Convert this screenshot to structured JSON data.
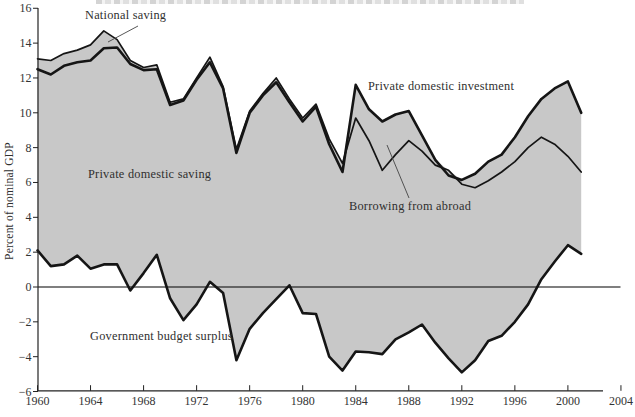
{
  "chart_data": {
    "type": "area",
    "ylabel": "Percent of nominal GDP",
    "xlim": [
      1960,
      2004
    ],
    "ylim": [
      -6,
      16
    ],
    "grid": false,
    "legend": "none (direct area labels with leader lines)",
    "x_ticks": [
      1960,
      1964,
      1968,
      1972,
      1976,
      1980,
      1984,
      1988,
      1992,
      1996,
      2000,
      2004
    ],
    "y_tick_values": [
      16,
      14,
      12,
      10,
      8,
      6,
      4,
      2,
      0,
      -2,
      -4,
      -6
    ],
    "y_tick_labels": [
      "16",
      "14",
      "12",
      "10",
      "8",
      "6",
      "4",
      "2",
      "0",
      "−2",
      "−4",
      "−6"
    ],
    "years": [
      1960,
      1961,
      1962,
      1963,
      1964,
      1965,
      1966,
      1967,
      1968,
      1969,
      1970,
      1971,
      1972,
      1973,
      1974,
      1975,
      1976,
      1977,
      1978,
      1979,
      1980,
      1981,
      1982,
      1983,
      1984,
      1985,
      1986,
      1987,
      1988,
      1989,
      1990,
      1991,
      1992,
      1993,
      1994,
      1995,
      1996,
      1997,
      1998,
      1999,
      2000,
      2001
    ],
    "series": [
      {
        "name": "National saving",
        "style": "thin dark line",
        "values": [
          13.1,
          13.0,
          13.4,
          13.6,
          13.9,
          14.7,
          14.2,
          13.0,
          12.6,
          12.75,
          10.6,
          10.8,
          12.0,
          13.2,
          11.5,
          7.9,
          10.1,
          11.1,
          12.0,
          10.8,
          9.7,
          10.5,
          8.5,
          7.1,
          9.7,
          8.4,
          6.7,
          7.6,
          8.4,
          7.8,
          7.0,
          6.7,
          5.9,
          5.7,
          6.1,
          6.6,
          7.2,
          8.0,
          8.6,
          8.2,
          7.5,
          6.6
        ]
      },
      {
        "name": "Private domestic investment",
        "style": "thick dark line (top of shaded area in later years)",
        "values": [
          12.5,
          12.2,
          12.7,
          12.9,
          13.0,
          13.7,
          13.75,
          12.8,
          12.45,
          12.5,
          10.45,
          10.7,
          11.9,
          12.9,
          11.4,
          7.7,
          10.0,
          11.0,
          11.75,
          10.6,
          9.5,
          10.35,
          8.2,
          6.6,
          11.6,
          10.2,
          9.5,
          9.9,
          10.1,
          8.7,
          7.3,
          6.4,
          6.15,
          6.5,
          7.2,
          7.6,
          8.6,
          9.8,
          10.8,
          11.4,
          11.8,
          10.0
        ]
      },
      {
        "name": "Government budget surplus",
        "style": "thick dark line (bottom of shaded area)",
        "values": [
          2.1,
          1.2,
          1.3,
          1.8,
          1.05,
          1.3,
          1.3,
          -0.2,
          0.8,
          1.85,
          -0.65,
          -1.9,
          -1.0,
          0.3,
          -0.35,
          -4.2,
          -2.4,
          -1.5,
          -0.7,
          0.1,
          -1.5,
          -1.55,
          -4.0,
          -4.8,
          -3.7,
          -3.75,
          -3.85,
          -3.0,
          -2.6,
          -2.15,
          -3.2,
          -4.1,
          -4.9,
          -4.2,
          -3.1,
          -2.8,
          -2.0,
          -1.0,
          0.45,
          1.45,
          2.4,
          1.9
        ]
      }
    ],
    "annotations": {
      "national_saving": "National saving",
      "private_domestic_saving": "Private domestic saving",
      "private_domestic_investment": "Private domestic investment",
      "borrowing_from_abroad": "Borrowing from abroad",
      "government_budget_surplus": "Government budget surplus"
    },
    "colors": {
      "area_fill": "#c8c8c8",
      "line": "#151515",
      "zero_line": "#000000",
      "text": "#2f2f2f",
      "tick_text": "#333333"
    }
  }
}
